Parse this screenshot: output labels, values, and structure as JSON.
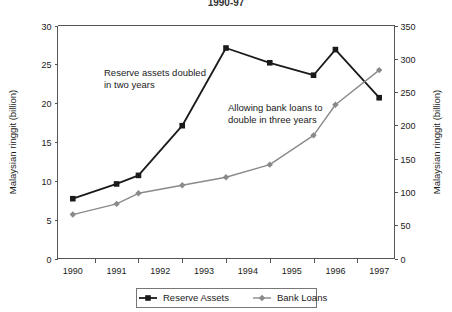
{
  "title": "1990-97",
  "chart_data": {
    "type": "line",
    "title": "1990-97",
    "xlabel": "",
    "ylabel": "Malaysian ringgit (billion)",
    "y2label": "Malaysian ringgit (billion)",
    "grid": false,
    "legend_position": "bottom",
    "x": [
      1990,
      1990.5,
      1991,
      1991.5,
      1992,
      1992.5,
      1993,
      1993.5,
      1994,
      1994.5,
      1995,
      1995.5,
      1996,
      1996.5,
      1997
    ],
    "xtick_labels": [
      "1990",
      "1991",
      "1992",
      "1993",
      "1994",
      "1995",
      "1996",
      "1997"
    ],
    "ylim": [
      0,
      30
    ],
    "ytick_labels": [
      "0",
      "5",
      "10",
      "15",
      "20",
      "25",
      "30"
    ],
    "ytick_values": [
      0,
      5,
      10,
      15,
      20,
      25,
      30
    ],
    "y2lim": [
      0,
      350
    ],
    "y2tick_labels": [
      "0",
      "50",
      "100",
      "150",
      "200",
      "250",
      "300",
      "350"
    ],
    "y2tick_values": [
      0,
      50,
      100,
      150,
      200,
      250,
      300,
      350
    ],
    "series": [
      {
        "name": "Reserve Assets",
        "axis": "left",
        "color": "#1a1a1a",
        "marker": "square",
        "x": [
          1990,
          1991,
          1991.5,
          1992.5,
          1993.5,
          1994.5,
          1995.5,
          1996,
          1997
        ],
        "values": [
          7.7,
          9.6,
          10.7,
          17.1,
          27.1,
          25.2,
          23.6,
          26.9,
          20.7
        ]
      },
      {
        "name": "Bank Loans",
        "axis": "right",
        "color": "#8a8a8a",
        "marker": "diamond",
        "x": [
          1990,
          1991,
          1991.5,
          1992.5,
          1993.5,
          1994.5,
          1995.5,
          1996,
          1997
        ],
        "values_left_scale": [
          5.7,
          7.0,
          8.4,
          9.4,
          10.5,
          12.1,
          15.9,
          19.8,
          24.3
        ],
        "values": [
          66,
          82,
          98,
          110,
          122,
          141,
          185,
          231,
          283
        ]
      }
    ],
    "annotations": [
      {
        "name": "reserve-assets-annotation",
        "line1": "Reserve assets doubled",
        "line2": "in two years"
      },
      {
        "name": "bank-loans-annotation",
        "line1": "Allowing bank loans to",
        "line2": "double in three years"
      }
    ]
  },
  "legend": {
    "items": [
      {
        "label": "Reserve Assets",
        "color": "#1a1a1a",
        "marker": "square"
      },
      {
        "label": "Bank Loans",
        "color": "#8a8a8a",
        "marker": "diamond"
      }
    ]
  }
}
